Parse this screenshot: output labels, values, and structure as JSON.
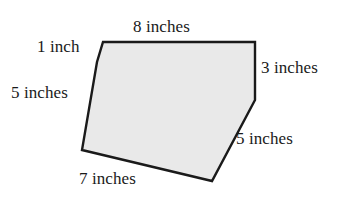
{
  "figure": {
    "shape_name": "irregular-hexagon",
    "fill_color": "#e9e9e9",
    "stroke_color": "#1a1a1a",
    "background_color": "#ffffff",
    "stroke_width": 2.4,
    "unit": "inches"
  },
  "labels": {
    "top": "8 inches",
    "top_left": "1 inch",
    "left": "5 inches",
    "right": "3 inches",
    "lower_right": "5 inches",
    "bottom": "7 inches"
  },
  "chart_data": {
    "type": "diagram",
    "vertices": [
      {
        "name": "top-left",
        "x": 103,
        "y": 42
      },
      {
        "name": "top-right",
        "x": 255,
        "y": 42
      },
      {
        "name": "right-bend",
        "x": 255,
        "y": 100
      },
      {
        "name": "bottom-right",
        "x": 212,
        "y": 181
      },
      {
        "name": "bottom-left",
        "x": 82,
        "y": 150
      },
      {
        "name": "notch",
        "x": 97,
        "y": 62
      }
    ],
    "sides": [
      {
        "from": "top-left",
        "to": "top-right",
        "length": 8,
        "unit": "inches",
        "label": "8 inches"
      },
      {
        "from": "top-right",
        "to": "right-bend",
        "length": 3,
        "unit": "inches",
        "label": "3 inches"
      },
      {
        "from": "right-bend",
        "to": "bottom-right",
        "length": 5,
        "unit": "inches",
        "label": "5 inches"
      },
      {
        "from": "bottom-right",
        "to": "bottom-left",
        "length": 7,
        "unit": "inches",
        "label": "7 inches"
      },
      {
        "from": "bottom-left",
        "to": "notch",
        "length": 5,
        "unit": "inches",
        "label": "5 inches"
      },
      {
        "from": "notch",
        "to": "top-left",
        "length": 1,
        "unit": "inches",
        "label": "1 inch"
      }
    ],
    "polygon_path": "M 103 42 L 255 42 L 255 100 L 212 181 L 82 150 L 97 62 Z"
  }
}
